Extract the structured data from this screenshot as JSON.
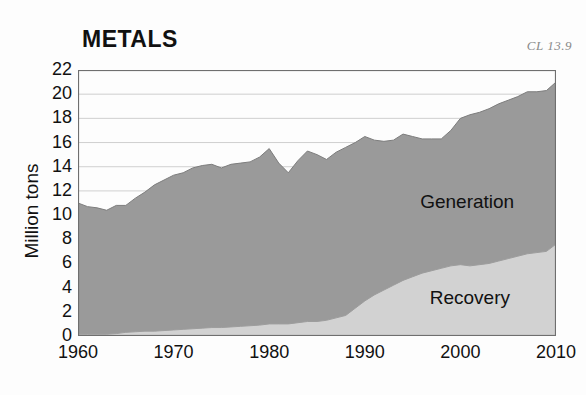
{
  "figure": {
    "title": "METALS",
    "corner_note": "CL 13.9",
    "background_color": "#fdfdfd"
  },
  "axes": {
    "ylabel": "Million tons",
    "ytick_labels": [
      "22",
      "20",
      "18",
      "16",
      "14",
      "12",
      "10",
      "8",
      "6",
      "4",
      "2",
      "0"
    ],
    "xtick_labels": [
      "1960",
      "1970",
      "1980",
      "1990",
      "2000",
      "2010"
    ]
  },
  "legend": {
    "generation_label": "Generation",
    "recovery_label": "Recovery"
  },
  "colors": {
    "generation_fill": "#9a9a9a",
    "recovery_fill": "#d2d2d2",
    "gridline": "#c9c9c9",
    "frame": "#6f6f6f",
    "text": "#111111",
    "corner_note": "#8a8a8a"
  },
  "chart_data": {
    "type": "area",
    "title": "METALS",
    "xlabel": "",
    "ylabel": "Million tons",
    "xlim": [
      1960,
      2010
    ],
    "ylim": [
      0,
      22
    ],
    "ytick_step": 2,
    "grid": true,
    "stacked": false,
    "legend_position": "inside-right",
    "annotations": [
      "CL 13.9"
    ],
    "x": [
      1960,
      1961,
      1962,
      1963,
      1964,
      1965,
      1966,
      1967,
      1968,
      1969,
      1970,
      1971,
      1972,
      1973,
      1974,
      1975,
      1976,
      1977,
      1978,
      1979,
      1980,
      1981,
      1982,
      1983,
      1984,
      1985,
      1986,
      1987,
      1988,
      1989,
      1990,
      1991,
      1992,
      1993,
      1994,
      1995,
      1996,
      1997,
      1998,
      1999,
      2000,
      2001,
      2002,
      2003,
      2004,
      2005,
      2006,
      2007,
      2008,
      2009,
      2010
    ],
    "series": [
      {
        "name": "Generation",
        "values": [
          11.0,
          10.7,
          10.6,
          10.4,
          10.8,
          10.8,
          11.4,
          11.9,
          12.5,
          12.9,
          13.3,
          13.5,
          13.9,
          14.1,
          14.2,
          13.9,
          14.2,
          14.3,
          14.4,
          14.8,
          15.5,
          14.3,
          13.5,
          14.5,
          15.3,
          15.0,
          14.6,
          15.2,
          15.6,
          16.0,
          16.5,
          16.2,
          16.1,
          16.2,
          16.7,
          16.5,
          16.3,
          16.3,
          16.3,
          17.0,
          18.0,
          18.3,
          18.5,
          18.8,
          19.2,
          19.5,
          19.8,
          20.2,
          20.2,
          20.3,
          21.0
        ]
      },
      {
        "name": "Recovery",
        "values": [
          0.15,
          0.15,
          0.15,
          0.15,
          0.2,
          0.3,
          0.35,
          0.4,
          0.4,
          0.45,
          0.5,
          0.55,
          0.6,
          0.65,
          0.7,
          0.7,
          0.75,
          0.8,
          0.85,
          0.9,
          1.0,
          1.0,
          1.0,
          1.1,
          1.2,
          1.2,
          1.3,
          1.5,
          1.7,
          2.3,
          2.9,
          3.4,
          3.8,
          4.2,
          4.6,
          4.9,
          5.2,
          5.4,
          5.6,
          5.8,
          5.9,
          5.8,
          5.9,
          6.0,
          6.2,
          6.4,
          6.6,
          6.8,
          6.9,
          7.0,
          7.6
        ]
      }
    ]
  }
}
